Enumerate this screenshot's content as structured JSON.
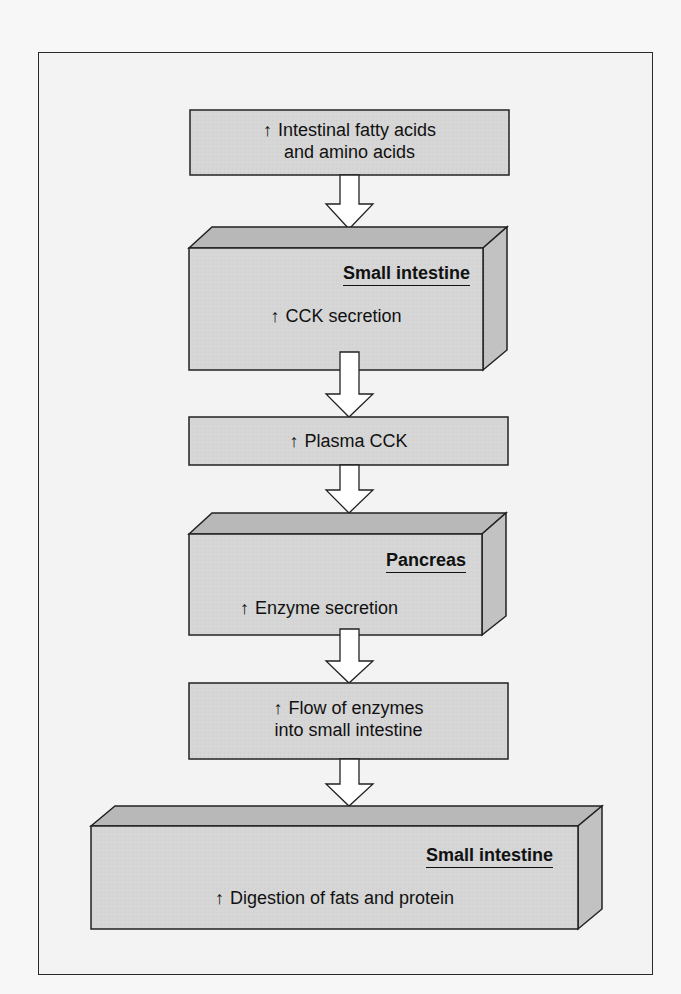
{
  "diagram": {
    "type": "flowchart",
    "colors": {
      "box_front": "#d6d6d6",
      "box_top": "#b8b8b8",
      "box_side": "#c2c2c2",
      "stroke": "#222222",
      "arrow_fill": "#ffffff",
      "background": "#f3f3f3"
    },
    "steps": [
      {
        "id": "step-1",
        "arrow": "↑",
        "lines": [
          "Intestinal fatty acids",
          "and amino acids"
        ],
        "organ": null
      },
      {
        "id": "step-2",
        "arrow": "↑",
        "lines": [
          "CCK secretion"
        ],
        "organ": "Small intestine"
      },
      {
        "id": "step-3",
        "arrow": "↑",
        "lines": [
          "Plasma CCK"
        ],
        "organ": null
      },
      {
        "id": "step-4",
        "arrow": "↑",
        "lines": [
          "Enzyme secretion"
        ],
        "organ": "Pancreas"
      },
      {
        "id": "step-5",
        "arrow": "↑",
        "lines": [
          "Flow of enzymes",
          "into small intestine"
        ],
        "organ": null
      },
      {
        "id": "step-6",
        "arrow": "↑",
        "lines": [
          "Digestion of fats and protein"
        ],
        "organ": "Small intestine"
      }
    ]
  }
}
